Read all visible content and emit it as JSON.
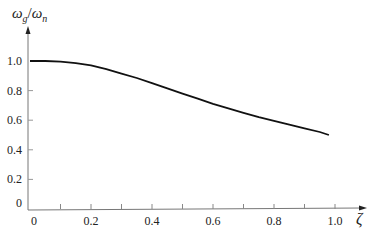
{
  "chart_data": {
    "type": "line",
    "title": "",
    "xlabel": "ζ",
    "ylabel": "ω_g/ω_n",
    "ylabel_parts": {
      "num": "ω",
      "num_sub": "g",
      "slash": "/",
      "den": "ω",
      "den_sub": "n"
    },
    "xlim": [
      0,
      1.0
    ],
    "ylim": [
      0,
      1.0
    ],
    "grid": false,
    "legend": null,
    "x_ticks": [
      0,
      0.1,
      0.2,
      0.3,
      0.4,
      0.5,
      0.6,
      0.7,
      0.8,
      0.9,
      1.0
    ],
    "x_tick_labels": [
      "0",
      "",
      "0.2",
      "",
      "0.4",
      "",
      "0.6",
      "",
      "0.8",
      "",
      "1.0"
    ],
    "y_ticks": [
      0,
      0.2,
      0.4,
      0.6,
      0.8,
      1.0
    ],
    "y_tick_labels": [
      "0",
      "0.2",
      "0.4",
      "0.6",
      "0.8",
      "1.0"
    ],
    "series": [
      {
        "name": "ω_g/ω_n",
        "color": "#111111",
        "x": [
          0,
          0.05,
          0.1,
          0.15,
          0.2,
          0.25,
          0.3,
          0.35,
          0.4,
          0.45,
          0.5,
          0.55,
          0.6,
          0.65,
          0.7,
          0.75,
          0.8,
          0.85,
          0.9,
          0.95,
          0.98
        ],
        "y": [
          1.0,
          1.0,
          0.995,
          0.985,
          0.97,
          0.945,
          0.915,
          0.885,
          0.85,
          0.815,
          0.78,
          0.745,
          0.71,
          0.68,
          0.65,
          0.62,
          0.595,
          0.57,
          0.545,
          0.52,
          0.5
        ]
      }
    ]
  }
}
